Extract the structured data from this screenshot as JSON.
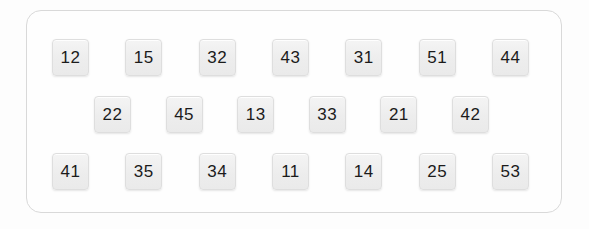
{
  "panel": {
    "background_color": "#fefefe",
    "border_color": "#d9d9d9",
    "tile_fill_color": "#efefef",
    "tile_border_color": "#dedede",
    "tile_text_color": "#1b1b1b",
    "rows": [
      {
        "name": "tile-row-1",
        "tiles": [
          {
            "label": "12"
          },
          {
            "label": "15"
          },
          {
            "label": "32"
          },
          {
            "label": "43"
          },
          {
            "label": "31"
          },
          {
            "label": "51"
          },
          {
            "label": "44"
          }
        ]
      },
      {
        "name": "tile-row-2",
        "tiles": [
          {
            "label": "22"
          },
          {
            "label": "45"
          },
          {
            "label": "13"
          },
          {
            "label": "33"
          },
          {
            "label": "21"
          },
          {
            "label": "42"
          }
        ]
      },
      {
        "name": "tile-row-3",
        "tiles": [
          {
            "label": "41"
          },
          {
            "label": "35"
          },
          {
            "label": "34"
          },
          {
            "label": "11"
          },
          {
            "label": "14"
          },
          {
            "label": "25"
          },
          {
            "label": "53"
          }
        ]
      }
    ]
  }
}
